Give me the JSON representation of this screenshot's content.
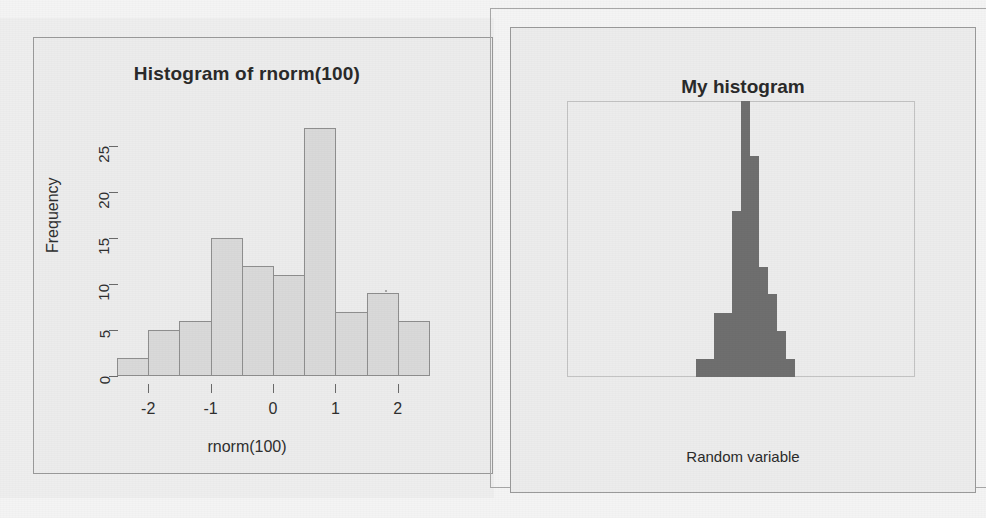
{
  "page": {
    "background": "#f4f4f4",
    "width": 986,
    "height": 518
  },
  "left_panel": {
    "title": "Histogram of rnorm(100)",
    "xlabel": "rnorm(100)",
    "ylabel": "Frequency",
    "bar_fill": "#d9d9d9",
    "bar_stroke": "#8e8e8e"
  },
  "right_panel": {
    "title": "My histogram",
    "xlabel": "Random variable",
    "bar_fill": "#6f6f6f"
  },
  "chart_data": [
    {
      "id": "histogram-rnorm",
      "type": "bar",
      "title": "Histogram of rnorm(100)",
      "xlabel": "rnorm(100)",
      "ylabel": "Frequency",
      "xlim": [
        -2.5,
        2.5
      ],
      "ylim": [
        0,
        27
      ],
      "yticks": [
        0,
        5,
        10,
        15,
        20,
        25
      ],
      "xticks": [
        -2,
        -1,
        0,
        1,
        2
      ],
      "grid": false,
      "legend": null,
      "bin_width": 0.5,
      "bin_edges": [
        -2.5,
        -2.0,
        -1.5,
        -1.0,
        -0.5,
        0.0,
        0.5,
        1.0,
        1.5,
        2.0,
        2.5
      ],
      "categories": [
        "[-2.5,-2)",
        "[-2,-1.5)",
        "[-1.5,-1)",
        "[-1,-0.5)",
        "[-0.5,0)",
        "[0,0.5)",
        "[0.5,1)",
        "[1,1.5)",
        "[1.5,2)",
        "[2,2.5)"
      ],
      "values": [
        2,
        5,
        6,
        15,
        12,
        11,
        27,
        7,
        9,
        6
      ]
    },
    {
      "id": "my-histogram",
      "type": "bar",
      "title": "My histogram",
      "xlabel": "Random variable",
      "ylabel": "",
      "xticks": [],
      "yticks": [],
      "grid": false,
      "legend": null,
      "ylim": [
        0,
        30
      ],
      "categories": [
        "b1",
        "b2",
        "b3",
        "b4",
        "b5",
        "b6",
        "b7",
        "b8",
        "b9",
        "b10",
        "b11"
      ],
      "values": [
        2,
        2,
        7,
        7,
        18,
        30,
        24,
        12,
        9,
        5,
        2
      ]
    }
  ]
}
